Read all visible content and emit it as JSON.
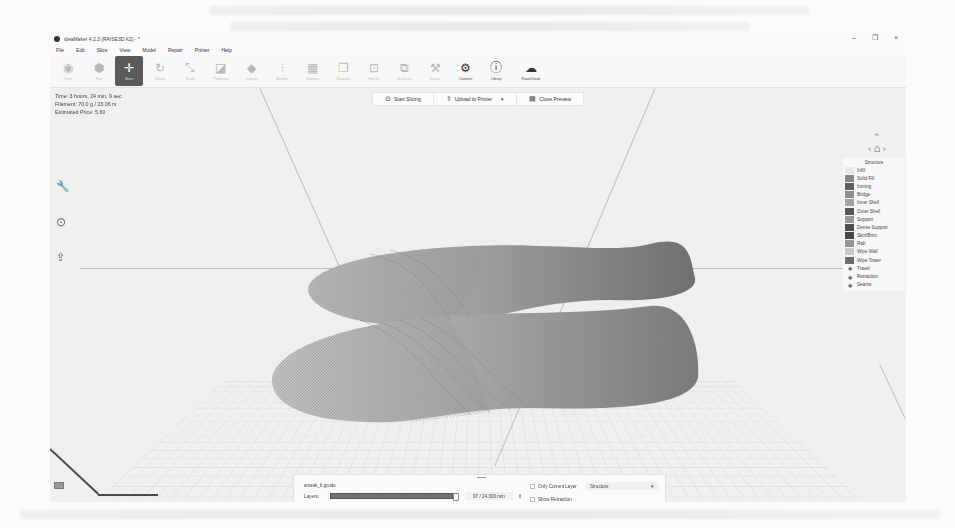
{
  "window": {
    "title": "ideaMaker 4.2.3 (RAISE3D K2) - *",
    "controls": {
      "minimize": "–",
      "restore": "❐",
      "close": "×"
    }
  },
  "menu": [
    "File",
    "Edit",
    "Slice",
    "View",
    "Model",
    "Repair",
    "Printer",
    "Help"
  ],
  "toolbar": {
    "tools": [
      {
        "label": "View",
        "icon": "eye-icon",
        "glyph": "◉",
        "state": "disabled"
      },
      {
        "label": "Part",
        "icon": "part-icon",
        "glyph": "⬢",
        "state": "disabled"
      },
      {
        "label": "Move",
        "icon": "move-icon",
        "glyph": "✛",
        "state": "active"
      },
      {
        "label": "Rotate",
        "icon": "rotate-icon",
        "glyph": "↻",
        "state": "disabled"
      },
      {
        "label": "Scale",
        "icon": "scale-icon",
        "glyph": "⤡",
        "state": "disabled"
      },
      {
        "label": "Projection",
        "icon": "projection-icon",
        "glyph": "◪",
        "state": "disabled"
      },
      {
        "label": "Layouts",
        "icon": "layouts-icon",
        "glyph": "◆",
        "state": "disabled"
      },
      {
        "label": "Modifier",
        "icon": "modifier-icon",
        "glyph": "⫶",
        "state": "disabled"
      },
      {
        "label": "Textures",
        "icon": "textures-icon",
        "glyph": "▦",
        "state": "disabled"
      },
      {
        "label": "Shadows",
        "icon": "shadows-icon",
        "glyph": "❐",
        "state": "disabled"
      },
      {
        "label": "Hex Kit",
        "icon": "hexkit-icon",
        "glyph": "⊡",
        "state": "disabled"
      },
      {
        "label": "Duplicate",
        "icon": "duplicate-icon",
        "glyph": "⧉",
        "state": "disabled"
      },
      {
        "label": "Repair",
        "icon": "repair-icon",
        "glyph": "⚒",
        "state": "disabled"
      },
      {
        "label": "Connect",
        "icon": "connect-icon",
        "glyph": "⚙",
        "state": "enabled"
      },
      {
        "label": "Library",
        "icon": "library-icon",
        "glyph": "ⓘ",
        "state": "enabled"
      },
      {
        "label": "RaiseCloud",
        "icon": "cloud-icon",
        "glyph": "☁",
        "state": "enabled"
      }
    ]
  },
  "info": {
    "time": "Time: 3 hours, 24 min, 9 sec",
    "filament": "Filament: 70.0 g / 23.06 m",
    "price": "Estimated Price: 5.60"
  },
  "actions": {
    "start_slicing": "Start Slicing",
    "upload": "Upload to Printer",
    "upload_dropdown": "▾",
    "close_preview": "Close Preview"
  },
  "navigator": {
    "up": "⌃",
    "left": "‹",
    "home": "⌂",
    "right": "›",
    "down": "⌄",
    "reset": "⟲"
  },
  "legend": {
    "title": "Structure",
    "items": [
      {
        "label": "Infill",
        "color": "#e8e8e8",
        "type": "swatch"
      },
      {
        "label": "Solid Fill",
        "color": "#858585",
        "type": "swatch"
      },
      {
        "label": "Ironing",
        "color": "#5e5e5e",
        "type": "swatch"
      },
      {
        "label": "Bridge",
        "color": "#8d8d8d",
        "type": "swatch"
      },
      {
        "label": "Inner Shell",
        "color": "#a3a3a3",
        "type": "swatch"
      },
      {
        "label": "Outer Shell",
        "color": "#575757",
        "type": "swatch"
      },
      {
        "label": "Support",
        "color": "#9a9a9a",
        "type": "swatch"
      },
      {
        "label": "Dense Support",
        "color": "#4d4d4d",
        "type": "swatch"
      },
      {
        "label": "Skirt/Brim",
        "color": "#474747",
        "type": "swatch"
      },
      {
        "label": "Raft",
        "color": "#949494",
        "type": "swatch"
      },
      {
        "label": "Wipe Wall",
        "color": "#c9c9c9",
        "type": "swatch"
      },
      {
        "label": "Wipe Tower",
        "color": "#6b6b6b",
        "type": "swatch"
      },
      {
        "label": "Travel",
        "type": "eye"
      },
      {
        "label": "Retraction",
        "type": "eye"
      },
      {
        "label": "Seams",
        "type": "eye"
      }
    ]
  },
  "bottom_panel": {
    "filename": "anwak_lt.gcode",
    "layers": {
      "label": "Layers:",
      "value": "97 / 24.300 mm"
    },
    "steps": {
      "label": "Steps:",
      "value": "72"
    },
    "only_current_layer": {
      "label": "Only Current Layer",
      "checked": false
    },
    "show_retraction": {
      "label": "Show Retraction",
      "checked": false
    },
    "no_travel_move": {
      "label": "No Travel Move",
      "checked": true
    },
    "view_mode": {
      "selected": "Structure"
    }
  },
  "left_tools": [
    {
      "icon": "wrench-icon",
      "glyph": "🔧"
    },
    {
      "icon": "play-circle-icon",
      "glyph": "⏵"
    },
    {
      "icon": "upload-icon",
      "glyph": "⇪"
    }
  ]
}
